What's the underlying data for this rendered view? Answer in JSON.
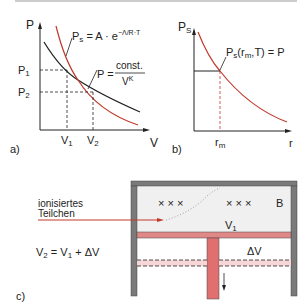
{
  "colors": {
    "ink": "#222222",
    "red": "#c0392b",
    "pink": "#e8a0a0",
    "wall": "#7a7a7a",
    "gas": "#f0f0f0"
  },
  "panel_a": {
    "label": "a)",
    "y_axis": "P",
    "x_axis": "V",
    "p1": "P",
    "p1_sub": "1",
    "p2": "P",
    "p2_sub": "2",
    "v1": "V",
    "v1_sub": "1",
    "v2": "V",
    "v2_sub": "2",
    "eq_ps_lhs": "P",
    "eq_ps_sub": "s",
    "eq_ps_rhs": " = A · e",
    "eq_ps_exp": "−Λ/R·T",
    "eq_p_lhs": "P =",
    "eq_p_num": "const.",
    "eq_p_den": "V",
    "eq_p_den_exp": "K"
  },
  "panel_b": {
    "label": "b)",
    "y_axis": "P",
    "y_axis_sub": "S",
    "x_axis": "r",
    "rm": "r",
    "rm_sub": "m",
    "eq": "P",
    "eq_sub": "s",
    "eq_rest": "(r",
    "eq_rm_sub": "m",
    "eq_tail": ",T) = P"
  },
  "panel_c": {
    "label": "c)",
    "particle_label_1": "ionisiertes",
    "particle_label_2": "Teilchen",
    "crosses": "× × ×",
    "crosses_right": "× × ×",
    "field": "B",
    "v1": "V",
    "v1_sub": "1",
    "dv": "ΔV",
    "eq_v2": "V",
    "eq_v2_sub": "2",
    "eq_mid": " = V",
    "eq_v1_sub": "1",
    "eq_tail": " + ΔV"
  }
}
